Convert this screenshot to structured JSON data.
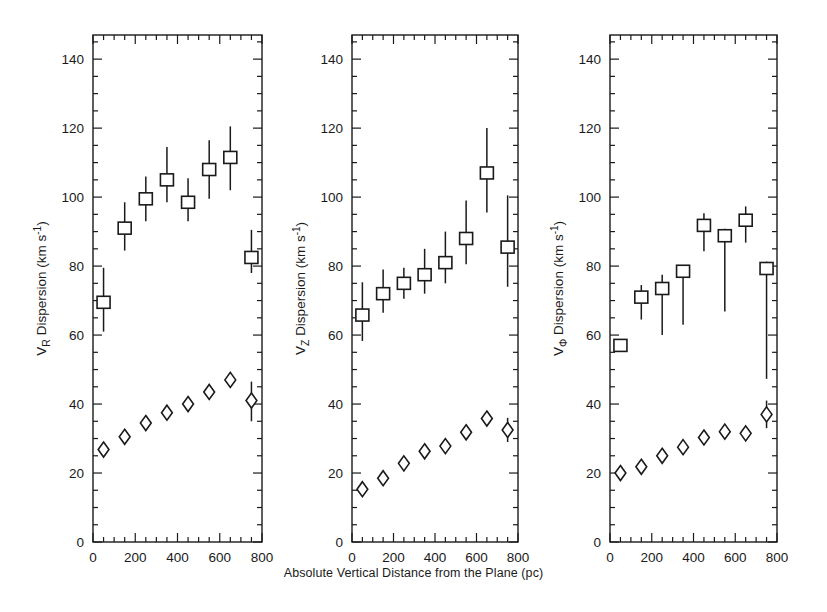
{
  "figure": {
    "xlabel": "Absolute Vertical Distance from the Plane (pc)",
    "background": "#ffffff",
    "ink": "#1a1a1a"
  },
  "axes": {
    "x_ticks": [
      0,
      200,
      400,
      600,
      800
    ],
    "x_tick_labels": [
      "0",
      "200",
      "400",
      "600",
      "800"
    ],
    "x_minor_step": 50,
    "xlim": [
      0,
      800
    ],
    "y_ticks": [
      0,
      20,
      40,
      60,
      80,
      100,
      120,
      140
    ],
    "y_tick_labels": [
      "0",
      "20",
      "40",
      "60",
      "80",
      "100",
      "120",
      "140"
    ],
    "y_minor_step": 5,
    "ylim": [
      0,
      147
    ],
    "grid": false
  },
  "chart_data": [
    {
      "type": "scatter",
      "panel": 1,
      "title": "",
      "ylabel": "V_R Dispersion (km s^-1)",
      "ylabel_base": "V",
      "ylabel_sub": "R",
      "ylabel_rest": " Dispersion (km s",
      "ylabel_sup": "-1",
      "ylabel_tail": ")",
      "xlabel": "Absolute Vertical Distance from the Plane (pc)",
      "xlim": [
        0,
        800
      ],
      "ylim": [
        0,
        147
      ],
      "x": [
        50,
        150,
        250,
        350,
        450,
        550,
        650,
        750
      ],
      "series": [
        {
          "name": "thick-disk-dispersion",
          "marker": "square",
          "values": [
            69.5,
            91.0,
            99.5,
            105.0,
            98.5,
            108.0,
            111.5,
            82.5
          ],
          "err_low": [
            8.5,
            6.5,
            6.5,
            6.5,
            5.5,
            8.5,
            9.5,
            4.5
          ],
          "err_high": [
            10.0,
            7.5,
            6.5,
            9.5,
            7.0,
            8.5,
            9.0,
            8.0
          ]
        },
        {
          "name": "thin-disk-dispersion",
          "marker": "diamond",
          "values": [
            26.8,
            30.5,
            34.5,
            37.5,
            40.0,
            43.5,
            47.0,
            41.0
          ],
          "err_low": [
            2.0,
            1.2,
            1.2,
            1.2,
            1.0,
            1.2,
            1.5,
            6.0
          ],
          "err_high": [
            2.0,
            1.2,
            1.2,
            1.2,
            1.0,
            1.2,
            1.5,
            5.5
          ]
        }
      ]
    },
    {
      "type": "scatter",
      "panel": 2,
      "title": "",
      "ylabel": "V_Z Dispersion (km s^-1)",
      "ylabel_base": "V",
      "ylabel_sub": "Z",
      "ylabel_rest": " Dispersion (km s",
      "ylabel_sup": "-1",
      "ylabel_tail": ")",
      "xlabel": "Absolute Vertical Distance from the Plane (pc)",
      "xlim": [
        0,
        800
      ],
      "ylim": [
        0,
        147
      ],
      "x": [
        50,
        150,
        250,
        350,
        450,
        550,
        650,
        750
      ],
      "series": [
        {
          "name": "thick-disk-dispersion",
          "marker": "square",
          "values": [
            65.8,
            72.0,
            75.0,
            77.5,
            81.0,
            88.0,
            107.0,
            85.5
          ],
          "err_low": [
            7.5,
            5.5,
            4.5,
            5.5,
            6.0,
            7.5,
            11.5,
            11.5
          ],
          "err_high": [
            9.5,
            7.0,
            4.5,
            7.5,
            9.0,
            11.0,
            13.0,
            15.0
          ]
        },
        {
          "name": "thin-disk-dispersion",
          "marker": "diamond",
          "values": [
            15.3,
            18.5,
            22.8,
            26.3,
            27.8,
            31.8,
            35.8,
            32.5
          ],
          "err_low": [
            1.0,
            1.0,
            1.0,
            1.0,
            1.0,
            1.0,
            1.2,
            3.5
          ],
          "err_high": [
            1.0,
            1.0,
            1.0,
            1.0,
            1.0,
            1.0,
            1.2,
            3.5
          ]
        }
      ]
    },
    {
      "type": "scatter",
      "panel": 3,
      "title": "",
      "ylabel": "V_Phi Dispersion (km s^-1)",
      "ylabel_base": "V",
      "ylabel_sub": "Φ",
      "ylabel_rest": " Dispersion (km s",
      "ylabel_sup": "-1",
      "ylabel_tail": ")",
      "xlabel": "Absolute Vertical Distance from the Plane (pc)",
      "xlim": [
        0,
        800
      ],
      "ylim": [
        0,
        147
      ],
      "x": [
        50,
        150,
        250,
        350,
        450,
        550,
        650,
        750
      ],
      "series": [
        {
          "name": "thick-disk-dispersion",
          "marker": "square",
          "values": [
            57.0,
            71.0,
            73.5,
            78.5,
            91.8,
            88.8,
            93.3,
            79.3
          ],
          "err_low": [
            0.8,
            6.5,
            13.5,
            15.5,
            7.5,
            22.0,
            6.5,
            32.0
          ],
          "err_high": [
            0.8,
            3.5,
            4.0,
            1.0,
            3.5,
            2.0,
            4.0,
            2.0
          ]
        },
        {
          "name": "thin-disk-dispersion",
          "marker": "diamond",
          "values": [
            20.0,
            21.8,
            25.0,
            27.5,
            30.3,
            32.0,
            31.5,
            37.0
          ],
          "err_low": [
            1.0,
            1.0,
            1.0,
            1.0,
            1.0,
            1.2,
            1.0,
            4.0
          ],
          "err_high": [
            1.0,
            1.0,
            1.0,
            1.0,
            1.0,
            1.2,
            1.0,
            4.0
          ]
        }
      ]
    }
  ]
}
